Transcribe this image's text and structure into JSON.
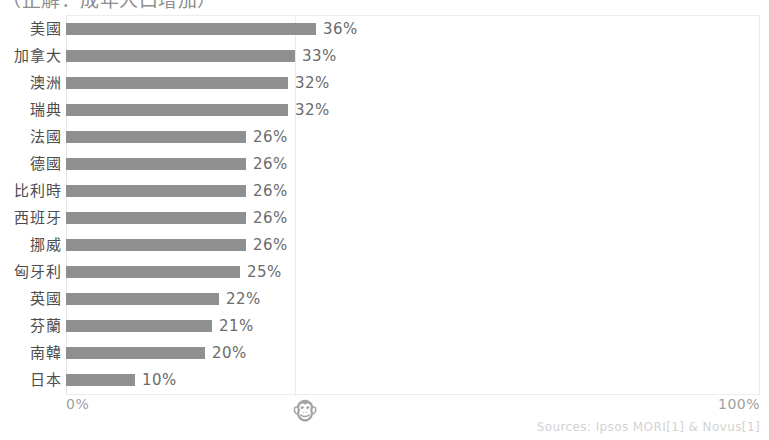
{
  "caption": {
    "text": "（正解：成年人口增加）"
  },
  "axis": {
    "min_label": "0%",
    "max_label": "100%"
  },
  "watermark": {
    "icon": "monkey-face-icon",
    "glyph": "🐵"
  },
  "source": {
    "text": "Sources: Ipsos MORI[1] & Novus[1]"
  },
  "style": {
    "bar_color": "#8f8f8f",
    "label_color": "#4d4d4d",
    "value_color": "#6b6b6b",
    "axis_color": "#a0a0a0",
    "grid_color": "#ececec",
    "source_color": "#d2d2d2",
    "background": "#ffffff"
  },
  "chart_data": {
    "type": "bar",
    "orientation": "horizontal",
    "title": "（正解：成年人口增加）",
    "xlabel": "",
    "ylabel": "",
    "xlim": [
      0,
      100
    ],
    "grid": true,
    "legend": false,
    "value_suffix": "%",
    "categories": [
      "美國",
      "加拿大",
      "澳洲",
      "瑞典",
      "法國",
      "德國",
      "比利時",
      "西班牙",
      "挪威",
      "匈牙利",
      "英國",
      "芬蘭",
      "南韓",
      "日本"
    ],
    "values": [
      36,
      33,
      32,
      32,
      26,
      26,
      26,
      26,
      26,
      25,
      22,
      21,
      20,
      10
    ],
    "labels": [
      "36%",
      "33%",
      "32%",
      "32%",
      "26%",
      "26%",
      "26%",
      "26%",
      "26%",
      "25%",
      "22%",
      "21%",
      "20%",
      "10%"
    ],
    "series": [
      {
        "name": "比例",
        "values": [
          36,
          33,
          32,
          32,
          26,
          26,
          26,
          26,
          26,
          25,
          22,
          21,
          20,
          10
        ]
      }
    ],
    "source": "Sources: Ipsos MORI[1] & Novus[1]"
  }
}
